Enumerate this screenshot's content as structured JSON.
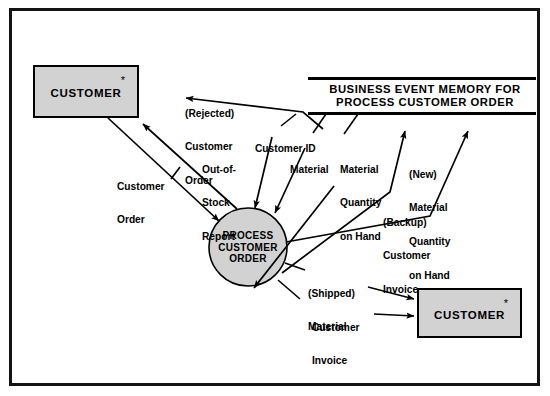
{
  "diagram": {
    "type": "data-flow-diagram",
    "frame_color": "#141414",
    "shape_fill": "#d2d2d2",
    "line_color": "#000000",
    "background": "#ffffff"
  },
  "external_entities": [
    {
      "id": "customer-top",
      "label": "CUSTOMER",
      "marker": "*"
    },
    {
      "id": "customer-bottom",
      "label": "CUSTOMER",
      "marker": "*"
    }
  ],
  "process": {
    "id": "process-customer-order",
    "line1": "PROCESS",
    "line2": "CUSTOMER",
    "line3": "ORDER"
  },
  "data_store": {
    "id": "business-event-memory",
    "line1": "BUSINESS EVENT MEMORY FOR",
    "line2": "PROCESS CUSTOMER ORDER"
  },
  "flows": [
    {
      "id": "rejected-customer-order",
      "line1": "(Rejected)",
      "line2": "Customer",
      "line3": "Order"
    },
    {
      "id": "out-of-stock-report",
      "line1": "Out-of-",
      "line2": "Stock",
      "line3": "Report"
    },
    {
      "id": "customer-order",
      "line1": "Customer",
      "line2": "Order"
    },
    {
      "id": "customer-id",
      "line1": "Customer ID"
    },
    {
      "id": "material",
      "line1": "Material"
    },
    {
      "id": "material-quantity-on-hand",
      "line1": "Material",
      "line2": "Quantity",
      "line3": "on Hand"
    },
    {
      "id": "new-material-quantity-on-hand",
      "line1": "(New)",
      "line2": "Material",
      "line3": "Quantity",
      "line4": "on Hand"
    },
    {
      "id": "backup-customer-invoice",
      "line1": "(Backup)",
      "line2": "Customer",
      "line3": "Invoice"
    },
    {
      "id": "shipped-material",
      "line1": "(Shipped)",
      "line2": "Material"
    },
    {
      "id": "customer-invoice",
      "line1": "Customer",
      "line2": "Invoice"
    }
  ]
}
